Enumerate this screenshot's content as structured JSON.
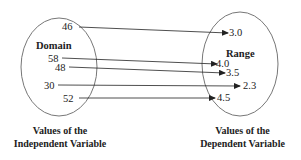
{
  "diagram": {
    "domain": {
      "title": "Domain",
      "values": [
        "46",
        "58",
        "48",
        "30",
        "52"
      ],
      "caption_line1": "Values of the",
      "caption_line2": "Independent Variable"
    },
    "range": {
      "title": "Range",
      "values": [
        "3.0",
        "4.0",
        "3.5",
        "2.3",
        "4.5"
      ],
      "caption_line1": "Values of the",
      "caption_line2": "Dependent Variable"
    },
    "mappings": [
      {
        "from": "46",
        "to": "3.0"
      },
      {
        "from": "58",
        "to": "4.0"
      },
      {
        "from": "48",
        "to": "3.5"
      },
      {
        "from": "30",
        "to": "2.3"
      },
      {
        "from": "52",
        "to": "4.5"
      }
    ],
    "colors": {
      "stroke": "#555555",
      "text": "#222222"
    }
  }
}
